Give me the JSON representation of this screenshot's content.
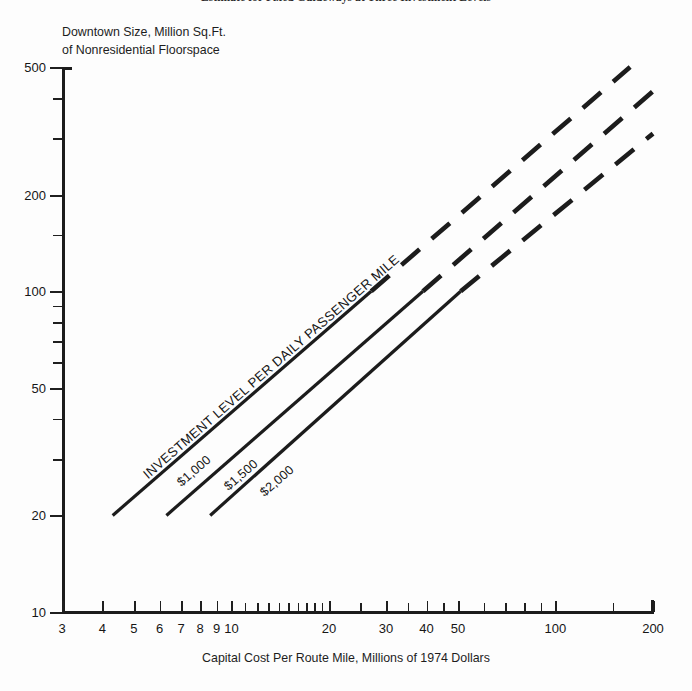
{
  "figure": {
    "title": "Estimate for Fixed Guideways at Three Investment Levels"
  },
  "axes": {
    "y_title_line1": "Downtown Size, Million Sq.Ft.",
    "y_title_line2": "of Nonresidential Floorspace",
    "x_title": "Capital Cost Per Route Mile, Millions of 1974 Dollars"
  },
  "annotations": {
    "main": "INVESTMENT LEVEL PER DAILY PASSENGER MILE",
    "series_1": "$1,000",
    "series_2": "$1,500",
    "series_3": "$2,000"
  },
  "chart_data": {
    "type": "line",
    "title": "Estimate for Fixed Guideways at Three Investment Levels",
    "xlabel": "Capital Cost Per Route Mile, Millions of 1974 Dollars",
    "ylabel": "Downtown Size, Million Sq.Ft. of Nonresidential Floorspace",
    "xscale": "log",
    "yscale": "log",
    "xlim": [
      3,
      200
    ],
    "ylim": [
      10,
      500
    ],
    "xticks": [
      3,
      4,
      5,
      6,
      7,
      8,
      9,
      10,
      20,
      30,
      40,
      50,
      100,
      200
    ],
    "xticklabels": [
      "3",
      "4",
      "5",
      "6",
      "7",
      "8",
      "9",
      "10",
      "20",
      "30",
      "40",
      "50",
      "100",
      "200"
    ],
    "yticks": [
      10,
      20,
      50,
      100,
      200,
      500
    ],
    "yticklabels": [
      "10",
      "20",
      "50",
      "100",
      "200",
      "500"
    ],
    "y_minor_ticks": [
      30,
      40,
      60,
      70,
      80,
      90,
      150,
      300,
      400
    ],
    "x_minor_ticks": [
      11,
      12,
      13,
      14,
      15,
      16,
      17,
      18,
      19,
      25,
      35,
      45,
      60,
      70,
      80,
      90,
      150
    ],
    "grid": false,
    "legend": "inline-labels-on-lines",
    "series": [
      {
        "name": "$1,000",
        "label": "$1,000",
        "style": "solid-then-dashed",
        "solid_from": [
          4.3,
          20
        ],
        "solid_to": [
          27,
          100
        ],
        "dashed_to": [
          170,
          500
        ],
        "points": [
          [
            4.3,
            20
          ],
          [
            27,
            100
          ],
          [
            170,
            500
          ]
        ]
      },
      {
        "name": "$1,500",
        "label": "$1,500",
        "style": "solid-then-dashed",
        "solid_from": [
          6.3,
          20
        ],
        "solid_to": [
          39,
          100
        ],
        "dashed_to": [
          200,
          420
        ],
        "points": [
          [
            6.3,
            20
          ],
          [
            39,
            100
          ],
          [
            200,
            420
          ]
        ]
      },
      {
        "name": "$2,000",
        "label": "$2,000",
        "style": "solid-then-dashed",
        "solid_from": [
          8.6,
          20
        ],
        "solid_to": [
          51,
          100
        ],
        "dashed_to": [
          200,
          310
        ],
        "points": [
          [
            8.6,
            20
          ],
          [
            51,
            100
          ],
          [
            200,
            310
          ]
        ]
      }
    ]
  },
  "colors": {
    "ink": "#1a1a1a",
    "line": "#1c1c1c",
    "background": "#fdfdfd"
  }
}
